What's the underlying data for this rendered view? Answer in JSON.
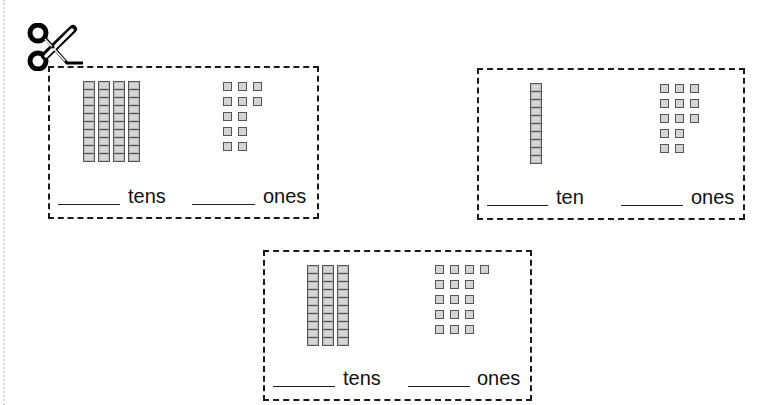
{
  "worksheet": {
    "cut_guide": {
      "icon": "scissors-icon",
      "line_style": "dashed"
    },
    "cards": [
      {
        "tens": 4,
        "ones_rows": [
          3,
          3,
          2,
          2,
          2
        ],
        "ones_total": 12,
        "tens_label": "tens",
        "ones_label": "ones"
      },
      {
        "tens": 1,
        "ones_rows": [
          3,
          3,
          3,
          2,
          2
        ],
        "ones_total": 13,
        "tens_label": "ten",
        "ones_label": "ones"
      },
      {
        "tens": 3,
        "ones_rows": [
          4,
          3,
          3,
          3,
          3
        ],
        "ones_total": 16,
        "tens_label": "tens",
        "ones_label": "ones"
      }
    ],
    "colors": {
      "border": "#1a1a1a",
      "block_fill": "#d4d4d4",
      "block_outline": "#555555"
    }
  }
}
